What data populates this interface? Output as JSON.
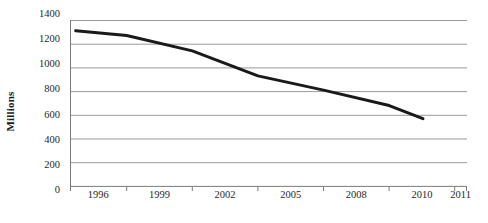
{
  "chart_data": {
    "type": "line",
    "title": "",
    "xlabel": "",
    "ylabel": "Millions",
    "x": [
      "1996",
      "1999",
      "2002",
      "2005",
      "2008",
      "2010",
      "2011"
    ],
    "categories": [
      "1996",
      "1999",
      "2002",
      "2005",
      "2008",
      "2010",
      "2011"
    ],
    "values": [
      1310,
      1270,
      1140,
      930,
      810,
      680,
      570
    ],
    "series": [
      {
        "name": "Millions",
        "values": [
          1310,
          1270,
          1140,
          930,
          810,
          680,
          570
        ]
      }
    ],
    "ylim": [
      0,
      1400
    ],
    "ytick_labels": [
      "1400",
      "1200",
      "1000",
      "800",
      "600",
      "400",
      "200",
      "0"
    ],
    "ytick_values": [
      1400,
      1200,
      1000,
      800,
      600,
      400,
      200,
      0
    ],
    "xtick_labels": [
      "1996",
      "1999",
      "2002",
      "2005",
      "2008",
      "2010",
      "2011"
    ],
    "grid": "horizontal",
    "legend": "none",
    "line_color": "#1a1a1a",
    "grid_color": "#9a9a9a",
    "axis_color": "#7a7a7a"
  }
}
